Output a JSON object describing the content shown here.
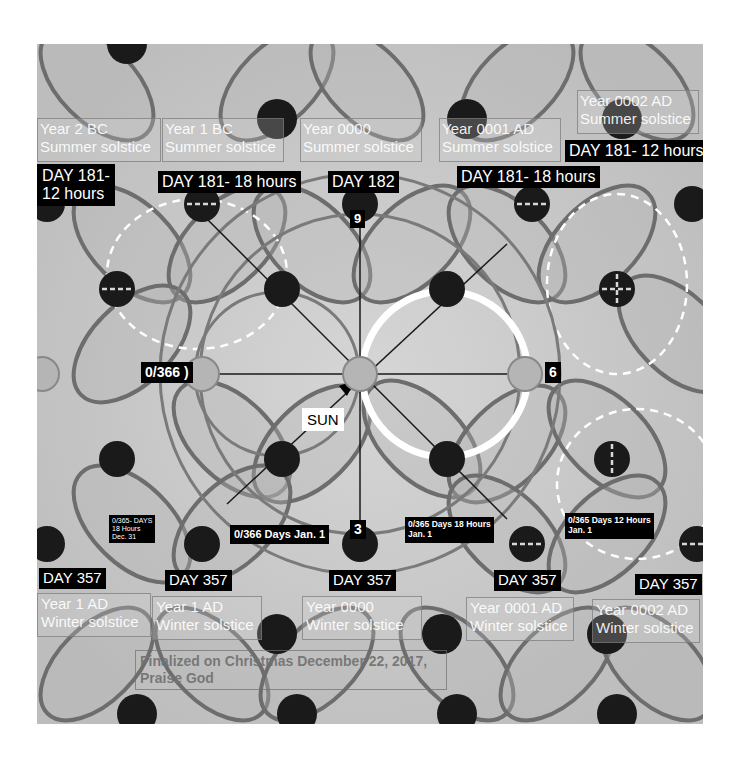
{
  "diagram": {
    "background": "#c9c9c9",
    "summer_labels": [
      {
        "year": "Year 2 BC",
        "event": "Summer solstice"
      },
      {
        "year": "Year 1 BC",
        "event": "Summer solstice"
      },
      {
        "year": "Year 0000",
        "event": "Summer solstice"
      },
      {
        "year": "Year 0001 AD",
        "event": "Summer solstice"
      },
      {
        "year": "Year 0002 AD",
        "event": "Summer solstice"
      }
    ],
    "summer_days": [
      {
        "line1": "DAY 181-",
        "line2": "12 hours"
      },
      {
        "text": "DAY 181- 18 hours"
      },
      {
        "text": "DAY 182"
      },
      {
        "text": "DAY 181- 18 hours"
      },
      {
        "text": "DAY 181- 12 hours"
      }
    ],
    "clock_marks": {
      "top": "9",
      "bottom": "3",
      "right": "6",
      "left": "0/366 )"
    },
    "sun_label": "SUN",
    "new_year_labels": [
      {
        "line1": "0/365- DAYS",
        "line2": "18 Hours",
        "line3": "Dec. 31"
      },
      {
        "text": "0/366 Days Jan. 1"
      },
      {
        "line1": "0/365 Days 18 Hours",
        "line2": "Jan. 1"
      },
      {
        "line1": "0/365 Days 12 Hours",
        "line2": "Jan. 1"
      }
    ],
    "winter_days": [
      "DAY 357",
      "DAY 357",
      "DAY 357",
      "DAY 357",
      "DAY 357"
    ],
    "winter_labels": [
      {
        "year": "Year 1 AD",
        "event": "Winter solstice"
      },
      {
        "year": "Year 1 AD",
        "event": "Winter solstice"
      },
      {
        "year": "Year 0000",
        "event": "Winter solstice"
      },
      {
        "year": "Year 0001 AD",
        "event": "Winter solstice"
      },
      {
        "year": "Year 0002 AD",
        "event": "Winter solstice"
      }
    ],
    "footer_note": {
      "line1": "Finalized on Christmas December 22, 2017,",
      "line2": "Praise God"
    }
  }
}
